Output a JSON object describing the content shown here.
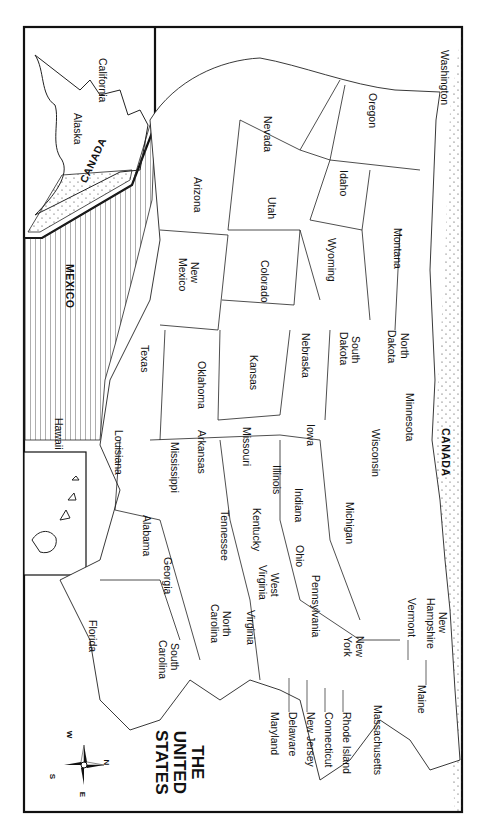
{
  "title": {
    "line1": "THE",
    "line2": "UNITED",
    "line3": "STATES"
  },
  "orientation": "rotated 90 degrees clockwise",
  "compass": {
    "n": "N",
    "s": "S",
    "e": "E",
    "w": "W"
  },
  "regions": {
    "canada_north": "CANADA",
    "canada_alaska": "CANADA",
    "mexico": "MEXICO"
  },
  "insets": {
    "alaska": "Alaska",
    "hawaii": "Hawaii"
  },
  "states": {
    "washington": "Washington",
    "oregon": "Oregon",
    "california": "California",
    "nevada": "Nevada",
    "idaho": "Idaho",
    "montana": "Montana",
    "wyoming": "Wyoming",
    "utah": "Utah",
    "arizona": "Arizona",
    "colorado": "Colorado",
    "new_mexico_1": "New",
    "new_mexico_2": "Mexico",
    "north_dakota_1": "North",
    "north_dakota_2": "Dakota",
    "south_dakota_1": "South",
    "south_dakota_2": "Dakota",
    "nebraska": "Nebraska",
    "kansas": "Kansas",
    "oklahoma": "Oklahoma",
    "texas": "Texas",
    "minnesota": "Minnesota",
    "iowa": "Iowa",
    "missouri": "Missouri",
    "arkansas": "Arkansas",
    "louisiana": "Louisiana",
    "wisconsin": "Wisconsin",
    "illinois": "Illinois",
    "mississippi": "Mississippi",
    "michigan": "Michigan",
    "indiana": "Indiana",
    "kentucky": "Kentucky",
    "tennessee": "Tennessee",
    "alabama": "Alabama",
    "ohio": "Ohio",
    "georgia": "Georgia",
    "florida": "Florida",
    "west_virginia_1": "West",
    "west_virginia_2": "Virginia",
    "virginia": "Virginia",
    "north_carolina_1": "North",
    "north_carolina_2": "Carolina",
    "south_carolina_1": "South",
    "south_carolina_2": "Carolina",
    "pennsylvania": "Pennsylvania",
    "new_york_1": "New",
    "new_york_2": "York",
    "vermont": "Vermont",
    "new_hampshire_1": "New",
    "new_hampshire_2": "Hampshire",
    "maine": "Maine",
    "massachusetts": "Massachusetts",
    "rhode_island": "Rhode Island",
    "connecticut": "Connecticut",
    "new_jersey": "New Jersey",
    "delaware": "Delaware",
    "maryland": "Maryland"
  }
}
